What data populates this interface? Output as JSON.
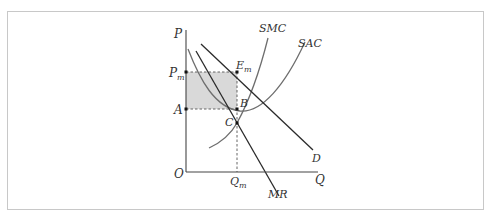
{
  "diagram": {
    "type": "monopoly-short-run-equilibrium",
    "axes": {
      "y_label": "P",
      "x_label": "Q",
      "origin_label": "O"
    },
    "curves": {
      "smc": "SMC",
      "sac": "SAC",
      "demand": "D",
      "marginal_revenue": "MR"
    },
    "levels": {
      "price_label": "P",
      "price_sub": "m",
      "avg_cost_label": "A",
      "quantity_label": "Q",
      "quantity_sub": "m"
    },
    "points": {
      "equilibrium_label": "E",
      "equilibrium_sub": "m",
      "b_label": "B",
      "c_label": "C"
    },
    "colors": {
      "line": "#2a2a2a",
      "curve": "#6e6e6e",
      "profit_area": "#d9d9d9",
      "dashed": "#555555",
      "frame": "#c8c8c8"
    }
  }
}
